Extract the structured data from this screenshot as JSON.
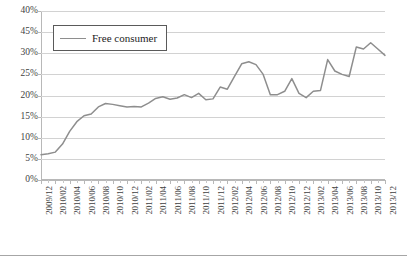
{
  "chart_data": {
    "type": "line",
    "title": "",
    "xlabel": "",
    "ylabel": "",
    "ylim": [
      0,
      40
    ],
    "ytick_labels": [
      "40%",
      "45%",
      "30%",
      "25%",
      "20%",
      "15%",
      "10%",
      "5%",
      "0%"
    ],
    "ytick_values": [
      40,
      35,
      30,
      25,
      20,
      15,
      10,
      5,
      0
    ],
    "ytick_note": "Second label from top reads 45% in the source image though it sits at the 35% gridline position",
    "grid": true,
    "legend_position": "upper-left",
    "series": [
      {
        "name": "Free consumer",
        "color": "#8e8e8e",
        "x": [
          "2009/12",
          "2010/01",
          "2010/02",
          "2010/03",
          "2010/04",
          "2010/05",
          "2010/06",
          "2010/07",
          "2010/08",
          "2010/09",
          "2010/10",
          "2010/11",
          "2010/12",
          "2011/01",
          "2011/02",
          "2011/03",
          "2011/04",
          "2011/05",
          "2011/06",
          "2011/07",
          "2011/08",
          "2011/09",
          "2011/10",
          "2011/11",
          "2011/12",
          "2012/01",
          "2012/02",
          "2012/03",
          "2012/04",
          "2012/05",
          "2012/06",
          "2012/07",
          "2012/08",
          "2012/09",
          "2012/10",
          "2012/11",
          "2012/12",
          "2013/01",
          "2013/02",
          "2013/03",
          "2013/04",
          "2013/05",
          "2013/06",
          "2013/07",
          "2013/08",
          "2013/09",
          "2013/10",
          "2013/11",
          "2013/12"
        ],
        "values": [
          6.0,
          6.2,
          6.6,
          8.5,
          11.5,
          13.8,
          15.2,
          15.6,
          17.3,
          18.1,
          17.9,
          17.6,
          17.3,
          17.4,
          17.3,
          18.2,
          19.3,
          19.7,
          19.1,
          19.4,
          20.2,
          19.5,
          20.5,
          19.0,
          19.2,
          22.0,
          21.5,
          24.5,
          27.5,
          28.0,
          27.3,
          25.0,
          20.2,
          20.2,
          21.0,
          24.0,
          20.5,
          19.5,
          21.0,
          21.2,
          28.5,
          25.8,
          25.0,
          24.5,
          31.5,
          31.0,
          32.5,
          31.0,
          29.5
        ]
      }
    ],
    "x_tick_labels": [
      "2009/12",
      "2010/02",
      "2010/04",
      "2010/06",
      "2010/08",
      "2010/10",
      "2010/12",
      "2011/02",
      "2011/04",
      "2011/06",
      "2011/08",
      "2011/10",
      "2011/12",
      "2012/02",
      "2012/04",
      "2012/06",
      "2012/08",
      "2012/10",
      "2012/12",
      "2013/02",
      "2013/04",
      "2013/06",
      "2013/08",
      "2013/10",
      "2013/12"
    ]
  },
  "legend": {
    "entry_label": "Free consumer"
  },
  "colors": {
    "line": "#8e8e8e",
    "grid": "#d2d2d2",
    "axis": "#b8b8b8",
    "text": "#3f3f3f",
    "legend_border": "#5a5a5a"
  }
}
